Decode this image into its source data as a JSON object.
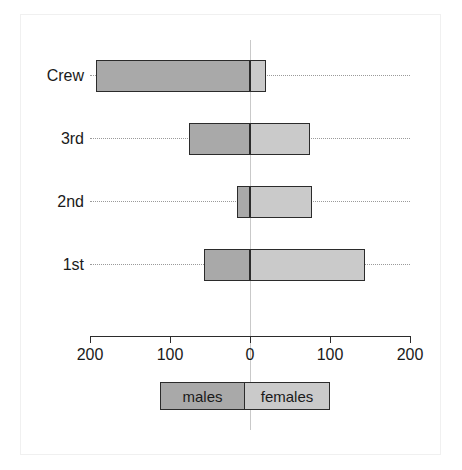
{
  "chart_data": {
    "type": "bar",
    "subtype": "diverging-horizontal-population-pyramid",
    "title": "",
    "xlabel": "",
    "ylabel": "",
    "categories": [
      "Crew",
      "3rd",
      "2nd",
      "1st"
    ],
    "series": [
      {
        "name": "males",
        "direction": "left",
        "color": "#a9a9a9",
        "values": [
          192,
          76,
          16,
          57
        ]
      },
      {
        "name": "females",
        "direction": "right",
        "color": "#cacaca",
        "values": [
          20,
          75,
          78,
          144
        ]
      }
    ],
    "xlim": [
      -200,
      200
    ],
    "x_tick_values": [
      -200,
      -100,
      0,
      100,
      200
    ],
    "x_tick_labels": [
      "200",
      "100",
      "0",
      "100",
      "200"
    ],
    "grid": false,
    "guidelines": "dotted",
    "legend": {
      "position": "bottom",
      "entries": [
        "males",
        "females"
      ]
    }
  },
  "axis": {
    "ticks": [
      {
        "label": "200",
        "value": -200
      },
      {
        "label": "100",
        "value": -100
      },
      {
        "label": "0",
        "value": 0
      },
      {
        "label": "100",
        "value": 100
      },
      {
        "label": "200",
        "value": 200
      }
    ]
  },
  "legend": {
    "males_label": "males",
    "females_label": "females"
  },
  "colors": {
    "male_fill": "#a9a9a9",
    "female_fill": "#cacaca",
    "bar_border": "#2b2b2b",
    "axis": "#2b2b2b",
    "guide": "#9a9a9a",
    "zero_line": "#c9c9c9",
    "background": "#ffffff",
    "frame": "#f0f0f0"
  }
}
